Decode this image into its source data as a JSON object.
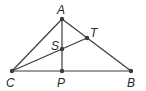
{
  "diagram": {
    "type": "geometry-triangle",
    "points": [
      {
        "id": "A",
        "label": "A",
        "x": 62,
        "y": 19,
        "lx": 57,
        "ly": 14
      },
      {
        "id": "B",
        "label": "B",
        "x": 131,
        "y": 71,
        "lx": 127,
        "ly": 87
      },
      {
        "id": "C",
        "label": "C",
        "x": 12,
        "y": 71,
        "lx": 6,
        "ly": 87
      },
      {
        "id": "P",
        "label": "P",
        "x": 62,
        "y": 71,
        "lx": 57,
        "ly": 87
      },
      {
        "id": "S",
        "label": "S",
        "x": 62,
        "y": 49,
        "lx": 51,
        "ly": 50
      },
      {
        "id": "T",
        "label": "T",
        "x": 87,
        "y": 38,
        "lx": 90,
        "ly": 37
      }
    ],
    "segments": [
      {
        "from": "A",
        "to": "C"
      },
      {
        "from": "A",
        "to": "B"
      },
      {
        "from": "C",
        "to": "B"
      },
      {
        "from": "A",
        "to": "P"
      },
      {
        "from": "C",
        "to": "T"
      }
    ],
    "colors": {
      "line": "#3c3c3c",
      "label": "#2a2a2a",
      "background": "#ffffff"
    }
  }
}
